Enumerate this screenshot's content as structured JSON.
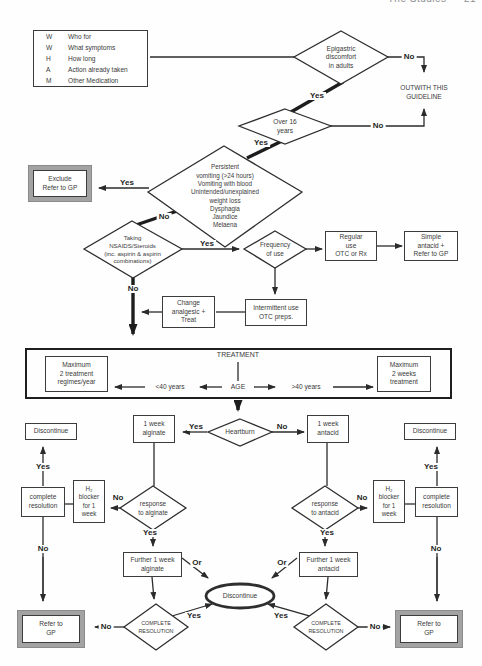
{
  "running_header": {
    "title": "The Studies",
    "page": "21"
  },
  "wwham": {
    "rows": [
      {
        "letter": "W",
        "label": "Who for"
      },
      {
        "letter": "W",
        "label": "What symptoms"
      },
      {
        "letter": "H",
        "label": "How long"
      },
      {
        "letter": "A",
        "label": "Action already taken"
      },
      {
        "letter": "M",
        "label": "Other Medication"
      }
    ]
  },
  "nodes": {
    "epigastric": "Epigastric\ndiscomfort\nin adults",
    "outwith": "OUTWITH THIS\nGUIDELINE",
    "over16": "Over 16\nyears",
    "symptoms": "Persistent\nvomiting (>24 hours)\nVomiting with blood\nUnintended/unexplained\nweight loss\nDysphagia\nJaundice\nMelaena",
    "exclude": "Exclude\nRefer to GP",
    "nsaids": "Taking\nNSAIDS/Steroids\n(inc. aspirin & aspirin\ncombinations)",
    "frequency": "Frequency\nof use",
    "regular": "Regular\nuse\nOTC or Rx",
    "simple": "Simple\nantacid +\nRefer to GP",
    "change": "Change\nanalgesic +\nTreat",
    "intermittent": "Intermittent use\nOTC preps.",
    "treatment": "TREATMENT",
    "age": "AGE",
    "lt40": "<40 years",
    "gt40": ">40 years",
    "max_regimes": "Maximum\n2 treatment\nregimes/year",
    "max_weeks": "Maximum\n2 weeks\ntreatment",
    "heartburn": "Heartburn",
    "week_alginate": "1 week\nalginate",
    "week_antacid": "1 week\nantacid",
    "discontinue_box": "Discontinue",
    "h2_blocker": "H₂\nblocker\nfor 1\nweek",
    "complete_resolution": "complete\nresolution",
    "response_alginate": "response\nto alginate",
    "response_antacid": "response\nto antacid",
    "further_alginate": "Further 1 week\nalginate",
    "further_antacid": "Further 1 week\nantacid",
    "discontinue_ellipse": "Discontinue",
    "complete_resolution_caps": "COMPLETE\nRESOLUTION",
    "refer_gp": "Refer to\nGP"
  },
  "labels": {
    "yes": "Yes",
    "no": "No",
    "or": "Or"
  }
}
